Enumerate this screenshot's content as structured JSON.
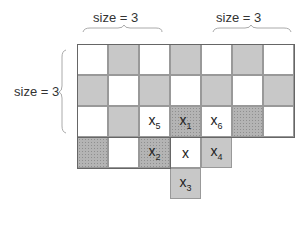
{
  "labels": {
    "top_left": "size = 3",
    "top_right": "size = 3",
    "left": "size = 3"
  },
  "grid": {
    "columns": 7,
    "cell_px": 31,
    "colors": {
      "white": "#ffffff",
      "gray": "#c8c8c8",
      "dotted": "#b4b4b4"
    },
    "rows": [
      [
        {
          "t": "w"
        },
        {
          "t": "g"
        },
        {
          "t": "w"
        },
        {
          "t": "g"
        },
        {
          "t": "w"
        },
        {
          "t": "g"
        },
        {
          "t": "w"
        }
      ],
      [
        {
          "t": "g"
        },
        {
          "t": "w"
        },
        {
          "t": "g"
        },
        {
          "t": "w"
        },
        {
          "t": "g"
        },
        {
          "t": "w"
        },
        {
          "t": "g"
        }
      ],
      [
        {
          "t": "w"
        },
        {
          "t": "g"
        },
        {
          "t": "w",
          "label": "x",
          "sub": "5"
        },
        {
          "t": "d",
          "label": "x",
          "sub": "1"
        },
        {
          "t": "w",
          "label": "x",
          "sub": "6"
        },
        {
          "t": "d"
        },
        {
          "t": "w"
        }
      ],
      [
        {
          "t": "d"
        },
        {
          "t": "w"
        },
        {
          "t": "d",
          "label": "x",
          "sub": "2"
        },
        {
          "t": "w",
          "label": "x"
        },
        {
          "t": "g",
          "label": "x",
          "sub": "4"
        }
      ],
      [
        null,
        null,
        null,
        {
          "t": "g",
          "label": "x",
          "sub": "3"
        }
      ]
    ]
  }
}
